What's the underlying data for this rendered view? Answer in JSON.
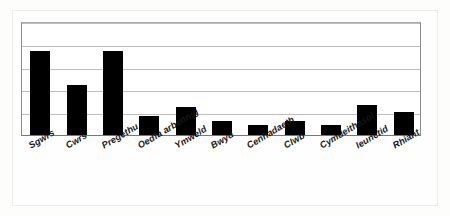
{
  "chart_data": {
    "type": "bar",
    "title": "",
    "subtitle": "",
    "xlabel": "",
    "ylabel": "",
    "ylim": [
      0,
      5
    ],
    "grid": true,
    "legend": false,
    "legend_position": "none",
    "axis_tick_labels": [],
    "bar_color": "#000000",
    "gridline_color": "#bdbdbd",
    "axis_color": "#777777",
    "categories": [
      "Sgwrs",
      "Cwrs",
      "Pregethu",
      "Oedfa arbennig",
      "Ymweld",
      "Bwyd",
      "Cenhadaeth",
      "Clwb",
      "Cymdeithasol",
      "Ieunctid",
      "Rhiant"
    ],
    "values": [
      3.7,
      2.2,
      3.7,
      0.85,
      1.25,
      0.6,
      0.45,
      0.6,
      0.45,
      1.3,
      1.0
    ],
    "gridline_values": [
      1,
      2,
      3,
      4,
      5
    ]
  },
  "figure": {
    "frame_label": "chart-frame",
    "plot_label": "plot-area"
  }
}
